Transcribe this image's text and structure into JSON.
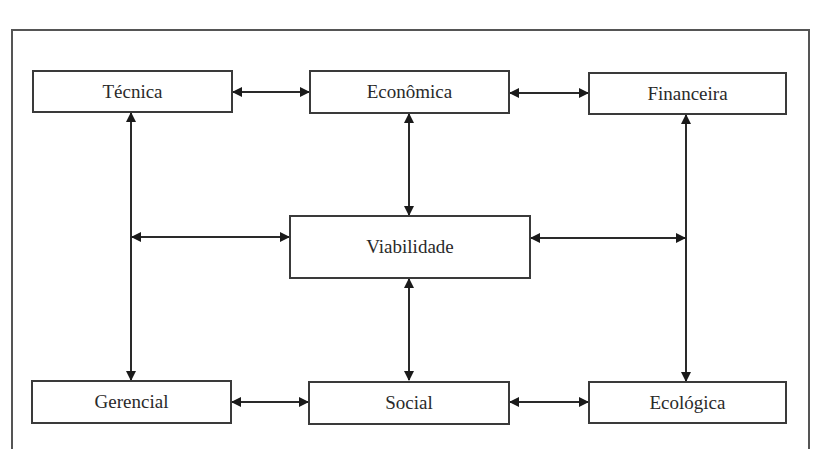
{
  "diagram": {
    "type": "flowchart",
    "center": {
      "id": "viabilidade",
      "label": "Viabilidade"
    },
    "nodes": [
      {
        "id": "tecnica",
        "label": "Técnica"
      },
      {
        "id": "economica",
        "label": "Econômica"
      },
      {
        "id": "financeira",
        "label": "Financeira"
      },
      {
        "id": "viabilidade",
        "label": "Viabilidade"
      },
      {
        "id": "gerencial",
        "label": "Gerencial"
      },
      {
        "id": "social",
        "label": "Social"
      },
      {
        "id": "ecologica",
        "label": "Ecológica"
      }
    ],
    "edges": [
      {
        "from": "tecnica",
        "to": "economica",
        "direction": "bidirectional"
      },
      {
        "from": "economica",
        "to": "financeira",
        "direction": "bidirectional"
      },
      {
        "from": "gerencial",
        "to": "social",
        "direction": "bidirectional"
      },
      {
        "from": "social",
        "to": "ecologica",
        "direction": "bidirectional"
      },
      {
        "from": "tecnica",
        "to": "gerencial",
        "direction": "bidirectional"
      },
      {
        "from": "financeira",
        "to": "ecologica",
        "direction": "bidirectional"
      },
      {
        "from": "economica",
        "to": "viabilidade",
        "direction": "bidirectional"
      },
      {
        "from": "viabilidade",
        "to": "social",
        "direction": "bidirectional"
      },
      {
        "from": "viabilidade",
        "to": "tecnica-gerencial-link",
        "direction": "bidirectional"
      },
      {
        "from": "viabilidade",
        "to": "financeira-ecologica-link",
        "direction": "bidirectional"
      }
    ]
  }
}
